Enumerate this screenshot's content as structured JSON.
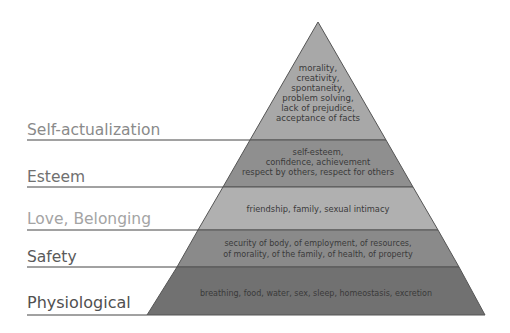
{
  "diagram": {
    "type": "pyramid",
    "levels": [
      {
        "name": "Self-actualization",
        "description_lines": [
          "morality,",
          "creativity,",
          "spontaneity,",
          "problem solving,",
          "lack of prejudice,",
          "acceptance of facts"
        ],
        "fill": "#a8a8a8",
        "label_color": "#8a8a8a"
      },
      {
        "name": "Esteem",
        "description_lines": [
          "self-esteem,",
          "confidence, achievement",
          "respect by others, respect for others"
        ],
        "fill": "#8f8f8f",
        "label_color": "#707070"
      },
      {
        "name": "Love, Belonging",
        "description_lines": [
          "friendship, family, sexual intimacy"
        ],
        "fill": "#b0b0b0",
        "label_color": "#a4a4a4"
      },
      {
        "name": "Safety",
        "description_lines": [
          "security of body, of employment, of resources,",
          "of morality, of the family, of health, of property"
        ],
        "fill": "#8a8a8a",
        "label_color": "#5a5a5a"
      },
      {
        "name": "Physiological",
        "description_lines": [
          "breathing, food, water, sex, sleep, homeostasis, excretion"
        ],
        "fill": "#707070",
        "label_color": "#505050"
      }
    ]
  }
}
